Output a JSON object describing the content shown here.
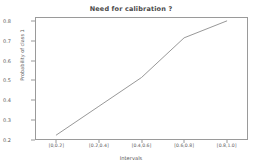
{
  "chart_data": {
    "type": "line",
    "title": "Need for calibration ?",
    "xlabel": "Intervals",
    "ylabel": "Probability of class 1",
    "categories": [
      "[0,0.2]",
      "[0.2,0.4]",
      "[0.4,0.6]",
      "[0.6,0.8]",
      "[0.8,1.0]"
    ],
    "values": [
      0.225,
      0.37,
      0.515,
      0.715,
      0.8
    ],
    "yticks": [
      "0.2",
      "0.3",
      "0.4",
      "0.5",
      "0.6",
      "0.7",
      "0.8"
    ],
    "ytick_values": [
      0.2,
      0.3,
      0.4,
      0.5,
      0.6,
      0.7,
      0.8
    ],
    "ylim": [
      0.2,
      0.82
    ],
    "grid": false,
    "legend": false,
    "line_color": "#8c8c8c",
    "series": [
      {
        "name": "calibration-curve",
        "values": [
          0.225,
          0.37,
          0.515,
          0.715,
          0.8
        ]
      }
    ]
  }
}
